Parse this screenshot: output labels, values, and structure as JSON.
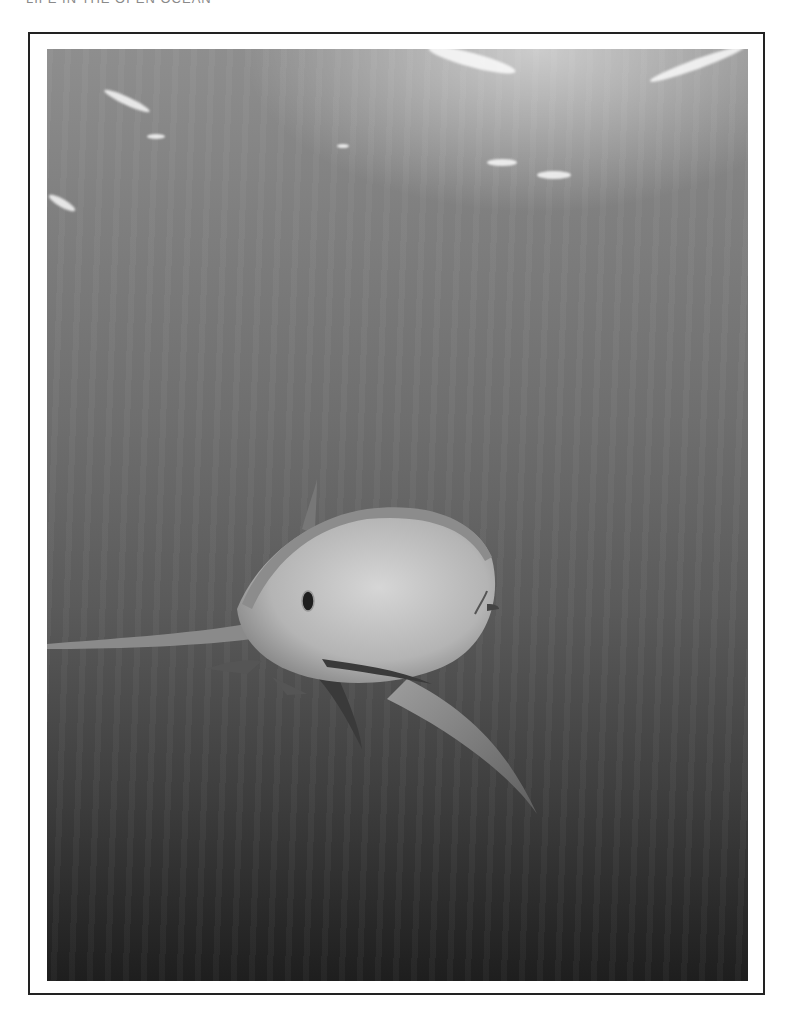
{
  "page": {
    "running_head": "LIFE IN THE OPEN OCEAN"
  },
  "figure": {
    "style": "grayscale photograph",
    "colors": {
      "frame_border": "#222222",
      "water_top": "#8e8e8e",
      "water_bottom": "#1e1e1e",
      "shark_belly": "#c8c8c8",
      "shark_back": "#9a9a9a"
    }
  }
}
